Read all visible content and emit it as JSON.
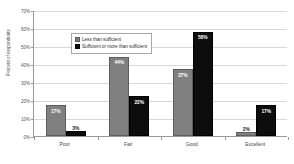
{
  "chart_data": {
    "type": "bar",
    "title": "",
    "subtitle": "",
    "xlabel": "",
    "ylabel": "Percent of respondents",
    "categories": [
      "Poor",
      "Fair",
      "Good",
      "Excellent"
    ],
    "series": [
      {
        "name": "Less than sufficient",
        "color": "#808080",
        "values": [
          17,
          44,
          37,
          2
        ],
        "labels": [
          "17%",
          "44%",
          "37%",
          "2%"
        ],
        "label_placement": [
          "inside",
          "inside",
          "inside",
          "outside"
        ]
      },
      {
        "name": "Sufficient or more than sufficient",
        "color": "#0d0d0d",
        "values": [
          3,
          22,
          58,
          17
        ],
        "labels": [
          "3%",
          "22%",
          "58%",
          "17%"
        ],
        "label_placement": [
          "outside",
          "inside",
          "inside",
          "inside"
        ]
      }
    ],
    "ylim": [
      0,
      70
    ],
    "y_ticks": [
      0,
      10,
      20,
      30,
      40,
      50,
      60,
      70
    ],
    "y_tick_labels": [
      "0%",
      "10%",
      "20%",
      "30%",
      "40%",
      "50%",
      "60%",
      "70%"
    ],
    "grid": true,
    "grid_axis": "y",
    "legend_position": "upper-left-inside",
    "axis_color": "#9a9a9a",
    "grid_color": "#d8d8d8",
    "background": "#ffffff"
  }
}
